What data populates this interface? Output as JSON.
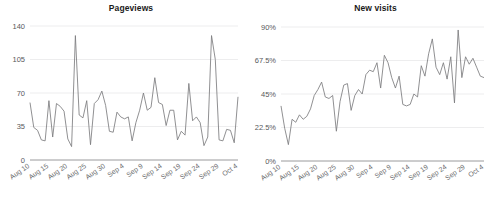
{
  "chart_data": [
    {
      "type": "line",
      "title": "Pageviews",
      "xlabel": "",
      "ylabel": "",
      "ylim": [
        0,
        140
      ],
      "yticks": [
        0,
        35,
        70,
        105,
        140
      ],
      "ytick_labels": [
        "0",
        "35",
        "70",
        "105",
        "140"
      ],
      "grid": true,
      "legend": "none",
      "xtick_labels": [
        "Aug 10",
        "Aug 15",
        "Aug 20",
        "Aug 25",
        "Aug 30",
        "Sep 4",
        "Sep 9",
        "Sep 14",
        "Sep 19",
        "Sep 24",
        "Sep 29",
        "Oct 4"
      ],
      "xtick_indices": [
        0,
        5,
        10,
        15,
        20,
        25,
        30,
        35,
        40,
        45,
        50,
        55
      ],
      "x": [
        "Aug 10",
        "Aug 11",
        "Aug 12",
        "Aug 13",
        "Aug 14",
        "Aug 15",
        "Aug 16",
        "Aug 17",
        "Aug 18",
        "Aug 19",
        "Aug 20",
        "Aug 21",
        "Aug 22",
        "Aug 23",
        "Aug 24",
        "Aug 25",
        "Aug 26",
        "Aug 27",
        "Aug 28",
        "Aug 29",
        "Aug 30",
        "Aug 31",
        "Sep 1",
        "Sep 2",
        "Sep 3",
        "Sep 4",
        "Sep 5",
        "Sep 6",
        "Sep 7",
        "Sep 8",
        "Sep 9",
        "Sep 10",
        "Sep 11",
        "Sep 12",
        "Sep 13",
        "Sep 14",
        "Sep 15",
        "Sep 16",
        "Sep 17",
        "Sep 18",
        "Sep 19",
        "Sep 20",
        "Sep 21",
        "Sep 22",
        "Sep 23",
        "Sep 24",
        "Sep 25",
        "Sep 26",
        "Sep 27",
        "Sep 28",
        "Sep 29",
        "Sep 30",
        "Oct 1",
        "Oct 2",
        "Oct 3",
        "Oct 4"
      ],
      "values": [
        60,
        34,
        31,
        21,
        20,
        62,
        24,
        59,
        56,
        51,
        22,
        14,
        130,
        47,
        44,
        62,
        16,
        59,
        63,
        72,
        57,
        30,
        29,
        50,
        45,
        43,
        45,
        20,
        39,
        52,
        70,
        52,
        55,
        86,
        60,
        58,
        36,
        52,
        52,
        21,
        30,
        26,
        80,
        41,
        45,
        39,
        15,
        24,
        130,
        105,
        21,
        20,
        32,
        31,
        18,
        66
      ]
    },
    {
      "type": "line",
      "title": "New visits",
      "xlabel": "",
      "ylabel": "",
      "ylim": [
        0,
        90
      ],
      "yticks": [
        0,
        22.5,
        45,
        67.5,
        90
      ],
      "ytick_labels": [
        "0%",
        "22.5%",
        "45%",
        "67.5%",
        "90%"
      ],
      "grid": true,
      "legend": "none",
      "unit": "%",
      "xtick_labels": [
        "Aug 10",
        "Aug 15",
        "Aug 20",
        "Aug 25",
        "Aug 30",
        "Sep 4",
        "Sep 9",
        "Sep 14",
        "Sep 19",
        "Sep 24",
        "Sep 29",
        "Oct 4"
      ],
      "xtick_indices": [
        0,
        5,
        10,
        15,
        20,
        25,
        30,
        35,
        40,
        45,
        50,
        55
      ],
      "x": [
        "Aug 10",
        "Aug 11",
        "Aug 12",
        "Aug 13",
        "Aug 14",
        "Aug 15",
        "Aug 16",
        "Aug 17",
        "Aug 18",
        "Aug 19",
        "Aug 20",
        "Aug 21",
        "Aug 22",
        "Aug 23",
        "Aug 24",
        "Aug 25",
        "Aug 26",
        "Aug 27",
        "Aug 28",
        "Aug 29",
        "Aug 30",
        "Aug 31",
        "Sep 1",
        "Sep 2",
        "Sep 3",
        "Sep 4",
        "Sep 5",
        "Sep 6",
        "Sep 7",
        "Sep 8",
        "Sep 9",
        "Sep 10",
        "Sep 11",
        "Sep 12",
        "Sep 13",
        "Sep 14",
        "Sep 15",
        "Sep 16",
        "Sep 17",
        "Sep 18",
        "Sep 19",
        "Sep 20",
        "Sep 21",
        "Sep 22",
        "Sep 23",
        "Sep 24",
        "Sep 25",
        "Sep 26",
        "Sep 27",
        "Sep 28",
        "Sep 29",
        "Sep 30",
        "Oct 1",
        "Oct 2",
        "Oct 3",
        "Oct 4"
      ],
      "values": [
        37,
        22,
        11,
        28,
        26,
        31,
        28,
        30,
        35,
        44,
        48,
        53,
        43,
        42,
        44,
        20,
        40,
        51,
        52,
        34,
        44,
        48,
        45,
        58,
        61,
        60,
        66,
        49,
        71,
        66,
        56,
        49,
        57,
        38,
        37,
        38,
        45,
        43,
        64,
        57,
        72,
        82,
        63,
        58,
        66,
        55,
        70,
        39,
        88,
        56,
        70,
        65,
        69,
        63,
        57,
        56
      ]
    }
  ],
  "layout": {
    "panels": [
      "pageviews-chart",
      "new-visits-chart"
    ],
    "background": "#ffffff",
    "line_color": "#7c7c7e",
    "grid_color": "#e9e9ea",
    "axis_color": "#9a9a9c",
    "title_color": "#1a1a1a",
    "tick_color": "#6b6c6e"
  }
}
